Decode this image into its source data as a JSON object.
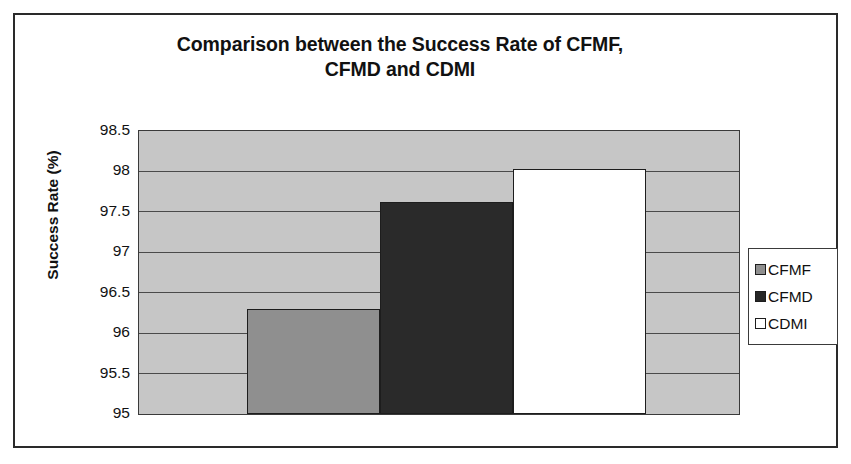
{
  "chart_data": {
    "type": "bar",
    "title": "Comparison between the Success Rate of CFMF, CFMD and CDMI",
    "title_lines": [
      "Comparison between the Success Rate of CFMF,",
      "CFMD and CDMI"
    ],
    "xlabel": "",
    "ylabel": "Success Rate (%)",
    "ylim": [
      95,
      98.5
    ],
    "ytick_labels": [
      "98.5",
      "98",
      "97.5",
      "97",
      "96.5",
      "96",
      "95.5",
      "95"
    ],
    "ytick_values": [
      98.5,
      98,
      97.5,
      97,
      96.5,
      96,
      95.5,
      95
    ],
    "categories": [
      "CFMF",
      "CFMD",
      "CDMI"
    ],
    "values": [
      96.3,
      97.62,
      98.03
    ],
    "grid": true,
    "legend_position": "right",
    "series": [
      {
        "name": "CFMF",
        "value": 96.3,
        "color": "#8f8f8f"
      },
      {
        "name": "CFMD",
        "value": 97.62,
        "color": "#2a2a2a"
      },
      {
        "name": "CDMI",
        "value": 98.03,
        "color": "#ffffff"
      }
    ],
    "plot_background": "#c6c6c6"
  },
  "legend": {
    "items": [
      {
        "label": "CFMF"
      },
      {
        "label": "CFMD"
      },
      {
        "label": "CDMI"
      }
    ]
  }
}
